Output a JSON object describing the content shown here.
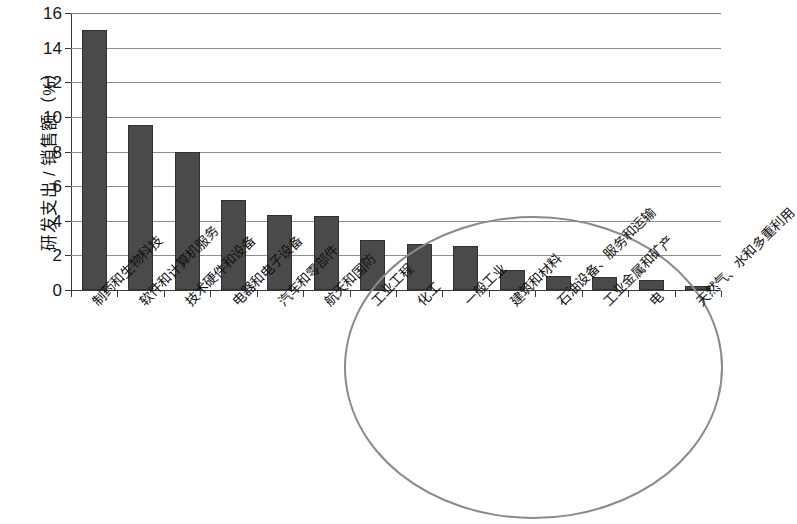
{
  "chart_data": {
    "type": "bar",
    "title": "",
    "xlabel": "",
    "ylabel": "研发支出 / 销售额（%）",
    "ylim": [
      0,
      16
    ],
    "ytick_labels": [
      "16",
      "14",
      "12",
      "10",
      "8",
      "6",
      "4",
      "2",
      "0"
    ],
    "ytick_values": [
      16,
      14,
      12,
      10,
      8,
      6,
      4,
      2,
      0
    ],
    "grid": true,
    "legend": "none",
    "categories": [
      "制药和生物科技",
      "软件和计算机服务",
      "技术硬件和设备",
      "电器和电子设备",
      "汽车和零部件",
      "航天和国防",
      "工业工程",
      "化工",
      "一般工业",
      "建筑和材料",
      "石油设备、服务和运输",
      "工业金属和矿产",
      "电",
      "天然气、水和多重利用"
    ],
    "values": [
      15.0,
      9.55,
      7.95,
      5.2,
      4.35,
      4.3,
      2.9,
      2.65,
      2.55,
      1.15,
      0.8,
      0.75,
      0.6,
      0.25
    ],
    "bar_color": "#4a4a4a",
    "annotation": {
      "shape": "ellipse",
      "color": "#8a8a8a",
      "label": "低研发强度行业高亮区域"
    }
  }
}
